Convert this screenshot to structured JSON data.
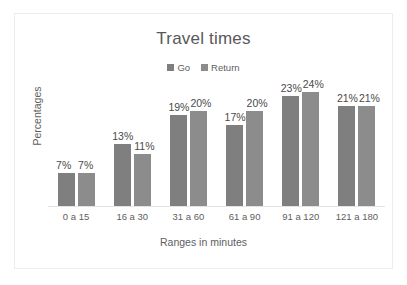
{
  "chart_data": {
    "type": "bar",
    "title": "Travel times",
    "xlabel": "Ranges in minutes",
    "ylabel": "Percentages",
    "categories": [
      "0 a 15",
      "16 a 30",
      "31 a 60",
      "61 a 90",
      "91 a 120",
      "121 a 180"
    ],
    "series": [
      {
        "name": "Go",
        "values": [
          7,
          13,
          19,
          17,
          23,
          21
        ],
        "color": "#7f7f7f"
      },
      {
        "name": "Return",
        "values": [
          7,
          11,
          20,
          20,
          24,
          21
        ],
        "color": "#8c8c8c"
      }
    ],
    "value_labels": {
      "go": [
        "7%",
        "13%",
        "19%",
        "17%",
        "23%",
        "21%"
      ],
      "return": [
        "7%",
        "11%",
        "20%",
        "20%",
        "24%",
        "21%"
      ]
    },
    "ylim": [
      0,
      26
    ],
    "grid": false,
    "legend_position": "top-center",
    "axis_line_color": "#e3e3e3",
    "text_color": "#5e5e5e"
  }
}
